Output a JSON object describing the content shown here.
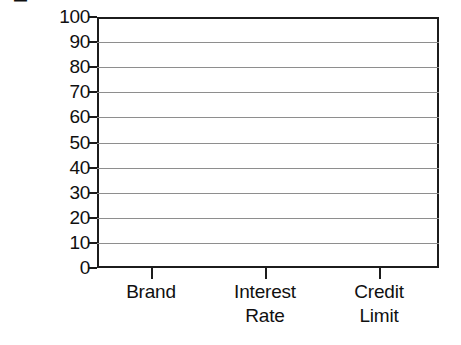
{
  "chart_data": {
    "type": "bar",
    "title": "",
    "subtitle": "",
    "xlabel": "",
    "ylabel": "Importance (percent)",
    "categories": [
      "Brand",
      "Interest Rate",
      "Credit Limit"
    ],
    "category_lines": [
      [
        "Brand"
      ],
      [
        "Interest",
        "Rate"
      ],
      [
        "Credit",
        "Limit"
      ]
    ],
    "values": [
      null,
      null,
      null
    ],
    "series": [],
    "ylim": [
      0,
      100
    ],
    "ytick_labels": [
      "0",
      "10",
      "20",
      "30",
      "40",
      "50",
      "60",
      "70",
      "80",
      "90",
      "100"
    ],
    "ytick_values": [
      0,
      10,
      20,
      30,
      40,
      50,
      60,
      70,
      80,
      90,
      100
    ],
    "ytick_interval": 10,
    "grid": true,
    "grid_axis": "y",
    "legend": false,
    "legend_position": "none",
    "annotations": [],
    "note": "Empty chart template: axes and gridlines drawn, no data bars plotted",
    "colors": {
      "axis": "#1c1c1c",
      "gridline": "#8e8e8e",
      "text": "#101010",
      "background": "#ffffff",
      "plot_background": "#ffffff"
    }
  }
}
